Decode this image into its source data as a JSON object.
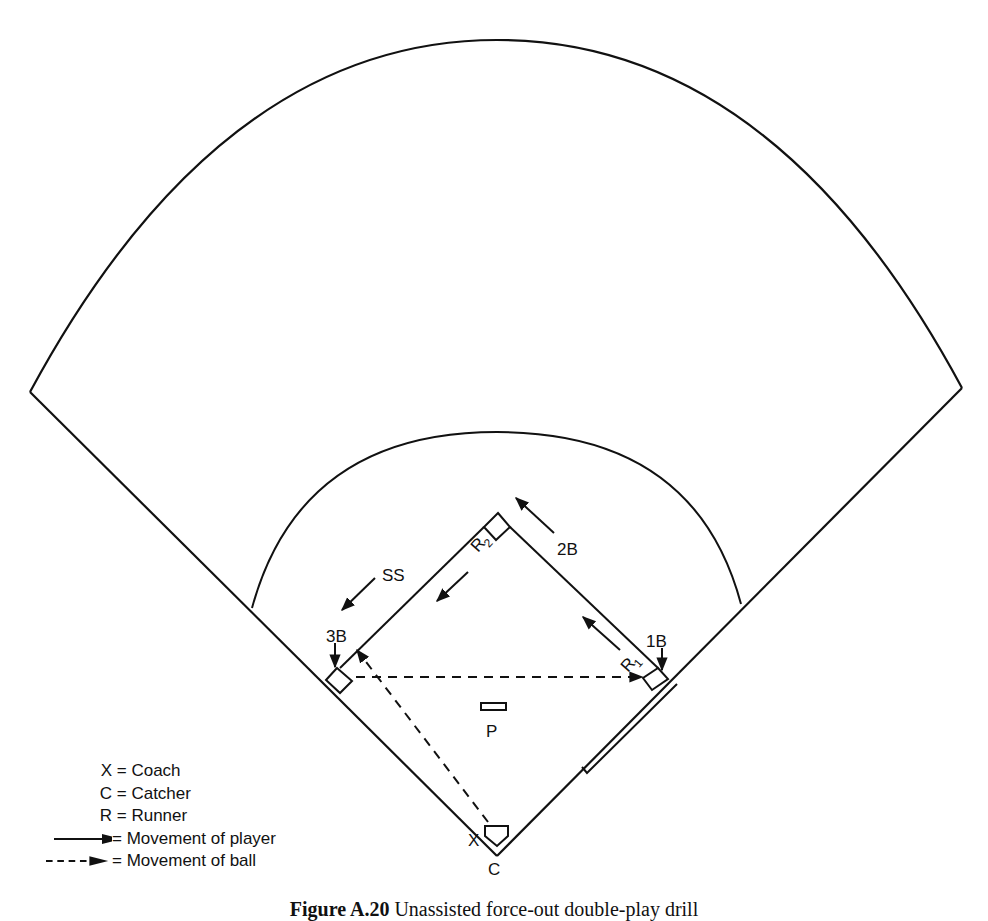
{
  "figure": {
    "caption_label": "Figure A.20",
    "caption_text": "Unassisted force-out double-play drill"
  },
  "field": {
    "positions": {
      "second_base": "2B",
      "shortstop": "SS",
      "third_base": "3B",
      "first_base": "1B",
      "pitcher": "P",
      "catcher": "C",
      "coach": "X"
    },
    "runners": {
      "r1": {
        "letter": "R",
        "sub": "1"
      },
      "r2": {
        "letter": "R",
        "sub": "2"
      }
    }
  },
  "legend": {
    "items": [
      {
        "symbol": "X",
        "sep": "=",
        "meaning": "Coach"
      },
      {
        "symbol": "C",
        "sep": "=",
        "meaning": "Catcher"
      },
      {
        "symbol": "R",
        "sep": "=",
        "meaning": "Runner"
      },
      {
        "symbol": "solid-arrow",
        "sep": "=",
        "meaning": "Movement of player"
      },
      {
        "symbol": "dashed-arrow",
        "sep": "=",
        "meaning": "Movement of ball"
      }
    ]
  },
  "colors": {
    "line": "#111111",
    "background": "#ffffff"
  }
}
